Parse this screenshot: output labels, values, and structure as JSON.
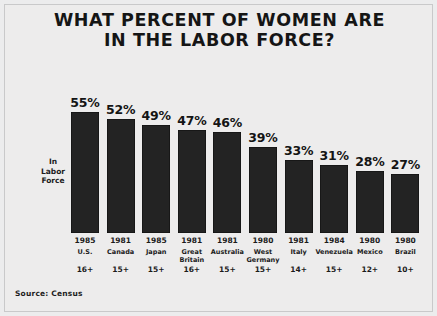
{
  "title": {
    "line1": "WHAT PERCENT OF WOMEN ARE",
    "line2": "IN THE LABOR FORCE?"
  },
  "axis_label": {
    "line1": "In",
    "line2": "Labor",
    "line3": "Force"
  },
  "source": "Source: Census",
  "colors": {
    "background": "#edecec",
    "bar": "#232323",
    "text": "#151515",
    "frame": "#c9c9ca"
  },
  "chart_data": {
    "type": "bar",
    "title": "WHAT PERCENT OF WOMEN ARE IN THE LABOR FORCE?",
    "subtitle": "",
    "xlabel": "",
    "ylabel": "In Labor Force",
    "ylim": [
      0,
      60
    ],
    "grid": false,
    "legend": "none",
    "source": "Source: Census",
    "categories": [
      "U.S.",
      "Canada",
      "Japan",
      "Great Britain",
      "Australia",
      "West Germany",
      "Italy",
      "Venezuela",
      "Mexico",
      "Brazil"
    ],
    "values": [
      55,
      52,
      49,
      47,
      46,
      39,
      33,
      31,
      28,
      27
    ],
    "value_labels": [
      "55%",
      "52%",
      "49%",
      "47%",
      "46%",
      "39%",
      "33%",
      "31%",
      "28%",
      "27%"
    ],
    "years": [
      "1985",
      "1981",
      "1985",
      "1981",
      "1981",
      "1980",
      "1981",
      "1984",
      "1980",
      "1980"
    ],
    "age_groups": [
      "16+",
      "15+",
      "15+",
      "16+",
      "15+",
      "15+",
      "14+",
      "15+",
      "12+",
      "10+"
    ],
    "bars": [
      {
        "country": "U.S.",
        "year": "1985",
        "age": "16+",
        "value": 55,
        "label": "55%"
      },
      {
        "country": "Canada",
        "year": "1981",
        "age": "15+",
        "value": 52,
        "label": "52%"
      },
      {
        "country": "Japan",
        "year": "1985",
        "age": "15+",
        "value": 49,
        "label": "49%"
      },
      {
        "country": "Great Britain",
        "year": "1981",
        "age": "16+",
        "value": 47,
        "label": "47%"
      },
      {
        "country": "Australia",
        "year": "1981",
        "age": "15+",
        "value": 46,
        "label": "46%"
      },
      {
        "country": "West Germany",
        "year": "1980",
        "age": "15+",
        "value": 39,
        "label": "39%"
      },
      {
        "country": "Italy",
        "year": "1981",
        "age": "14+",
        "value": 33,
        "label": "33%"
      },
      {
        "country": "Venezuela",
        "year": "1984",
        "age": "15+",
        "value": 31,
        "label": "31%"
      },
      {
        "country": "Mexico",
        "year": "1980",
        "age": "12+",
        "value": 28,
        "label": "28%"
      },
      {
        "country": "Brazil",
        "year": "1980",
        "age": "10+",
        "value": 27,
        "label": "27%"
      }
    ]
  }
}
